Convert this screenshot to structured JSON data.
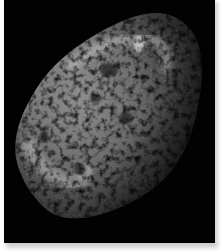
{
  "image": {
    "subject": "Irregular sponge-like cratered moon on black space background",
    "alt": "Grayscale photograph of a heavily cratered, elongated moon lit from upper left against black space",
    "colors": {
      "background": "#020202",
      "border": "#ffffff",
      "shadow": "#cfcfcf",
      "surface_highlight": "#d8d8d8",
      "surface_mid": "#7a7a7a",
      "surface_dark": "#1c1c1c"
    }
  }
}
